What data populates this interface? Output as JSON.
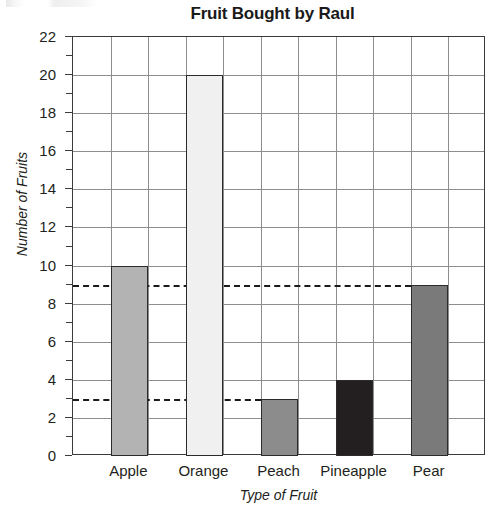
{
  "chart_data": {
    "type": "bar",
    "title": "Fruit Bought by Raul",
    "xlabel": "Type of Fruit",
    "ylabel": "Number of Fruits",
    "categories": [
      "Apple",
      "Orange",
      "Peach",
      "Pineapple",
      "Pear"
    ],
    "values": [
      10,
      20,
      3,
      4,
      9
    ],
    "ylim": [
      0,
      22
    ],
    "y_major_ticks": [
      0,
      2,
      4,
      6,
      8,
      10,
      12,
      14,
      16,
      18,
      20,
      22
    ],
    "y_major_tick_labels": [
      "0",
      "2",
      "4",
      "6",
      "8",
      "10",
      "12",
      "14",
      "16",
      "18",
      "20",
      "22"
    ],
    "y_minor_ticks": [
      1,
      3,
      5,
      7,
      9,
      11,
      13,
      15,
      17,
      19,
      21
    ],
    "grid": "horizontal-and-vertical",
    "legend": "none",
    "bar_colors": [
      "#b3b3b3",
      "#f0f0f0",
      "#8c8c8c",
      "#231f20",
      "#7a7a7a"
    ],
    "bar_edge_color": "#2b2b2b",
    "grid_color": "#8d8d8d",
    "axis_color": "#3b3b3b",
    "text_color": "#231f20",
    "annotations": [
      {
        "name": "reference-line-9",
        "type": "dashed-horizontal-line",
        "value": 9,
        "stops_at_category": "Pear"
      },
      {
        "name": "reference-line-3",
        "type": "dashed-horizontal-line",
        "value": 3,
        "stops_at_category": "Peach"
      }
    ]
  }
}
